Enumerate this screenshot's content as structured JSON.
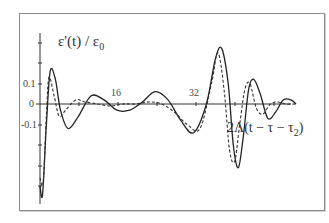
{
  "chart_data": {
    "type": "line",
    "title": "",
    "ylabel": "ε'(t) / ε₀",
    "xlabel": "2Λ(t − τ − τ₂)",
    "x_tick_labels": [
      "16",
      "32"
    ],
    "y_tick_labels": [
      "0.1",
      "0",
      "-0.1"
    ],
    "ylim": [
      -0.45,
      0.35
    ],
    "xlim": [
      0,
      40
    ],
    "grid": false,
    "legend": null,
    "series": [
      {
        "name": "solid",
        "style": "solid",
        "x": [
          0,
          0.4,
          1.0,
          1.6,
          2.4,
          3.2,
          4.4,
          6.0,
          8.0,
          10.0,
          12.0,
          14.0,
          16.0,
          18.0,
          20.0,
          22.0,
          24.0,
          26.0,
          27.4,
          28.4,
          29.4,
          30.2,
          31.0,
          31.8,
          32.6,
          33.4,
          34.4,
          35.6,
          36.8,
          38.0,
          39.2,
          40.0
        ],
        "y": [
          -0.4,
          -0.44,
          -0.1,
          0.16,
          0.12,
          -0.03,
          -0.12,
          -0.06,
          0.04,
          0.02,
          -0.03,
          -0.03,
          0.01,
          0.06,
          0.02,
          -0.08,
          -0.14,
          0.0,
          0.22,
          0.27,
          0.1,
          -0.2,
          -0.31,
          -0.15,
          0.07,
          0.12,
          0.05,
          -0.07,
          -0.04,
          0.02,
          0.02,
          0.0
        ]
      },
      {
        "name": "dashed",
        "style": "dashed",
        "x": [
          0,
          0.5,
          1.0,
          1.4,
          2.2,
          3.0,
          4.0,
          5.6,
          7.0,
          9.0,
          11.0,
          13.0,
          15.0,
          17.0,
          19.0,
          21.0,
          23.0,
          25.0,
          26.8,
          27.8,
          28.8,
          29.6,
          30.4,
          31.2,
          32.0,
          32.8,
          33.8,
          34.8,
          36.0,
          37.2,
          38.4,
          40.0
        ],
        "y": [
          -0.36,
          -0.38,
          -0.05,
          0.13,
          0.04,
          -0.06,
          -0.03,
          0.02,
          0.01,
          0.0,
          -0.01,
          0.0,
          0.0,
          0.01,
          0.0,
          -0.04,
          -0.1,
          -0.12,
          0.1,
          0.25,
          0.06,
          -0.22,
          -0.28,
          -0.1,
          0.07,
          0.1,
          -0.02,
          -0.05,
          0.0,
          0.01,
          0.0,
          0.0
        ]
      }
    ]
  },
  "labels": {
    "ylabel": "ε'(t) / ε",
    "ylabel_sub": "0",
    "xlabel_main": "2Λ(t − τ − τ",
    "xlabel_sub": "2",
    "xlabel_close": ")",
    "tick_16": "16",
    "tick_32": "32",
    "tick_01": "0.1",
    "tick_0": "0",
    "tick_m01": "-0.1"
  }
}
